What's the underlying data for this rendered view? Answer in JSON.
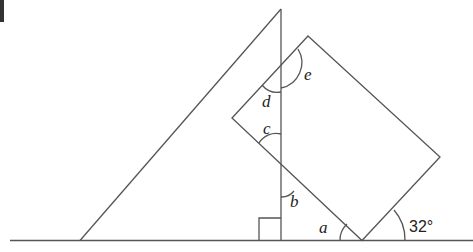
{
  "diagram": {
    "type": "geometry",
    "line_color": "#555555",
    "labels": {
      "a": "a",
      "b": "b",
      "c": "c",
      "d": "d",
      "e": "e",
      "given_angle": "32°"
    },
    "marks": {
      "right_angle": "right-angle square at foot of vertical line"
    }
  }
}
